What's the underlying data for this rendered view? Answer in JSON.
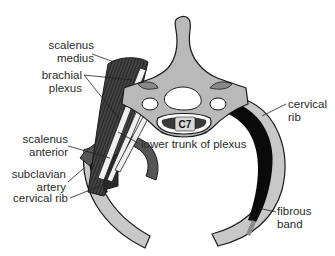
{
  "figure": {
    "type": "anatomical-diagram",
    "vertebra_label": "C7",
    "labels": {
      "scalenus_medius": {
        "line1": "scalenus",
        "line2": "medius"
      },
      "brachial_plexus": {
        "line1": "brachial",
        "line2": "plexus"
      },
      "scalenus_anterior": {
        "line1": "scalenus",
        "line2": "anterior"
      },
      "subclavian_artery": {
        "line1": "subclavian",
        "line2": "artery"
      },
      "cervical_rib_left": {
        "line1": "cervical rib"
      },
      "lower_trunk": {
        "line1": "lower trunk of plexus"
      },
      "cervical_rib_right": {
        "line1": "cervical",
        "line2": "rib"
      },
      "fibrous_band": {
        "line1": "fibrous",
        "line2": "band"
      }
    },
    "colors": {
      "bone": "#b9b9b9",
      "bone_outline": "#1a1a1a",
      "rib_light": "#c8c8c8",
      "cervical_rib_dark": "#0a0a0a",
      "muscle": "#3a3a3a",
      "artery": "#555555",
      "nerve": "#e8e8e8",
      "leader_line": "#222222",
      "text": "#2a2a2a"
    }
  }
}
